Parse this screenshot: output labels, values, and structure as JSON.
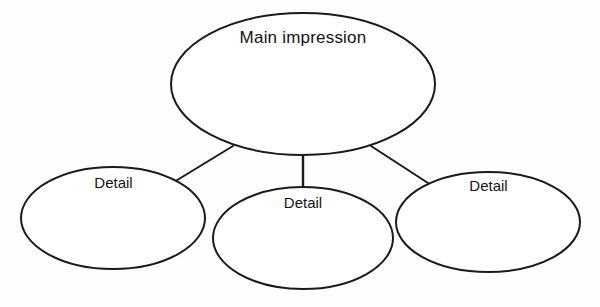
{
  "diagram": {
    "type": "cluster-web-organizer",
    "background_color": "#fefefe",
    "stroke_color": "#1a1a1a",
    "text_color": "#141414",
    "nodes": [
      {
        "id": "main",
        "label": "Main impression",
        "shape": "ellipse",
        "cx": 303,
        "cy": 84,
        "rx": 132,
        "ry": 71
      },
      {
        "id": "detail-left",
        "label": "Detail",
        "shape": "ellipse",
        "cx": 113,
        "cy": 218,
        "rx": 92,
        "ry": 51
      },
      {
        "id": "detail-center",
        "label": "Detail",
        "shape": "ellipse",
        "cx": 303,
        "cy": 238,
        "rx": 90,
        "ry": 51
      },
      {
        "id": "detail-right",
        "label": "Detail",
        "shape": "ellipse",
        "cx": 488,
        "cy": 222,
        "rx": 92,
        "ry": 50
      }
    ],
    "connectors": [
      {
        "id": "main-to-detail-left",
        "from": "main",
        "to": "detail-left",
        "x1": 233,
        "y1": 146,
        "x2": 174,
        "y2": 182
      },
      {
        "id": "main-to-detail-center",
        "from": "main",
        "to": "detail-center",
        "x1": 303,
        "y1": 155,
        "x2": 303,
        "y2": 188
      },
      {
        "id": "main-to-detail-right",
        "from": "main",
        "to": "detail-right",
        "x1": 371,
        "y1": 146,
        "x2": 428,
        "y2": 183
      }
    ]
  }
}
